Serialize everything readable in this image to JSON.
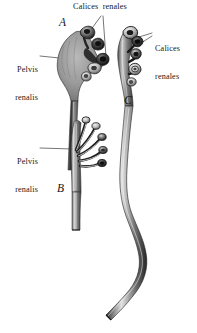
{
  "figure": {
    "background_color": "#ffffff",
    "ink_color": "#1a1a1a",
    "width": 197,
    "height": 333
  },
  "labels": {
    "calices_top": "Calices  renales",
    "calices_right_line1": "Calices",
    "calices_right_line2": "renales",
    "pelvis_upper_line1": "Pelvis",
    "pelvis_upper_line2": "renalis",
    "pelvis_lower_line1": "Pelvis",
    "pelvis_lower_line2": "renalis"
  },
  "part_letters": {
    "a": "A",
    "b": "B",
    "c": "C"
  },
  "specimens": [
    {
      "letter": "A",
      "label": "Calices renales",
      "secondary_label": "Pelvis renalis",
      "description": "Ampullary renal pelvis with short calyces, solid shaded body"
    },
    {
      "letter": "B",
      "label": "Pelvis renalis",
      "description": "Branching dendritic type with multiple elongated calyces"
    },
    {
      "letter": "C",
      "label": "Calices renales",
      "description": "Narrow intermediate type with long sinuous ureter"
    }
  ]
}
